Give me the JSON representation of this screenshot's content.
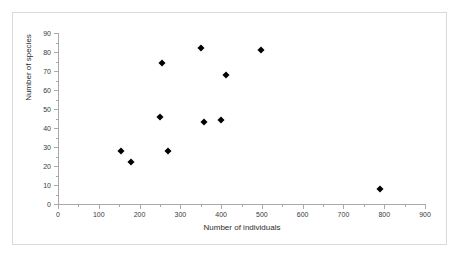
{
  "chart_data": {
    "type": "scatter",
    "title": "",
    "xlabel": "Number of individuals",
    "ylabel": "Number of species",
    "xlim": [
      0,
      900
    ],
    "ylim": [
      0,
      90
    ],
    "x_major_step": 100,
    "x_minor_step": 50,
    "y_major_step": 10,
    "y_minor_step": 5,
    "grid": false,
    "legend": false,
    "marker": "diamond",
    "marker_color": "#000000",
    "x_ticks": [
      0,
      100,
      200,
      300,
      400,
      500,
      600,
      700,
      800,
      900
    ],
    "y_ticks": [
      0,
      10,
      20,
      30,
      40,
      50,
      60,
      70,
      80,
      90
    ],
    "points": [
      {
        "x": 155,
        "y": 28
      },
      {
        "x": 180,
        "y": 22
      },
      {
        "x": 250,
        "y": 46
      },
      {
        "x": 255,
        "y": 74
      },
      {
        "x": 270,
        "y": 28
      },
      {
        "x": 350,
        "y": 82
      },
      {
        "x": 357,
        "y": 43
      },
      {
        "x": 400,
        "y": 44
      },
      {
        "x": 412,
        "y": 68
      },
      {
        "x": 497,
        "y": 81
      },
      {
        "x": 790,
        "y": 8
      }
    ]
  },
  "figure": {
    "border_color": "#d9d9d9",
    "background": "#ffffff",
    "axis_color": "#aaaaaa"
  }
}
